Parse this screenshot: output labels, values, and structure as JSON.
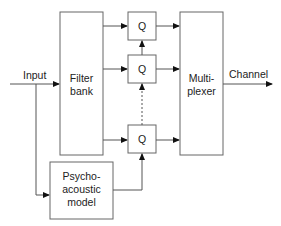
{
  "diagram": {
    "type": "block-diagram",
    "colors": {
      "stroke": "#666666",
      "text": "#222222",
      "background": "#ffffff"
    },
    "labels": {
      "input": "Input",
      "channel": "Channel",
      "filter_bank_line1": "Filter",
      "filter_bank_line2": "bank",
      "quantizer": "Q",
      "mux_line1": "Multi-",
      "mux_line2": "plexer",
      "psy_line1": "Psycho-",
      "psy_line2": "acoustic",
      "psy_line3": "model"
    },
    "blocks": [
      {
        "id": "filter-bank",
        "label": "Filter bank"
      },
      {
        "id": "quantizer-1",
        "label": "Q"
      },
      {
        "id": "quantizer-2",
        "label": "Q"
      },
      {
        "id": "quantizer-n",
        "label": "Q"
      },
      {
        "id": "multiplexer",
        "label": "Multi-plexer"
      },
      {
        "id": "psychoacoustic-model",
        "label": "Psycho-acoustic model"
      }
    ],
    "edges": [
      {
        "from": "Input",
        "to": "filter-bank"
      },
      {
        "from": "Input",
        "to": "psychoacoustic-model"
      },
      {
        "from": "filter-bank",
        "to": "quantizer-1"
      },
      {
        "from": "filter-bank",
        "to": "quantizer-2"
      },
      {
        "from": "filter-bank",
        "to": "quantizer-n"
      },
      {
        "from": "quantizer-1",
        "to": "multiplexer"
      },
      {
        "from": "quantizer-2",
        "to": "multiplexer"
      },
      {
        "from": "quantizer-n",
        "to": "multiplexer"
      },
      {
        "from": "psychoacoustic-model",
        "to": "quantizer-n"
      },
      {
        "from": "quantizer-n",
        "to": "quantizer-2",
        "style": "dashed"
      },
      {
        "from": "quantizer-2",
        "to": "quantizer-1"
      },
      {
        "from": "multiplexer",
        "to": "Channel"
      }
    ]
  }
}
